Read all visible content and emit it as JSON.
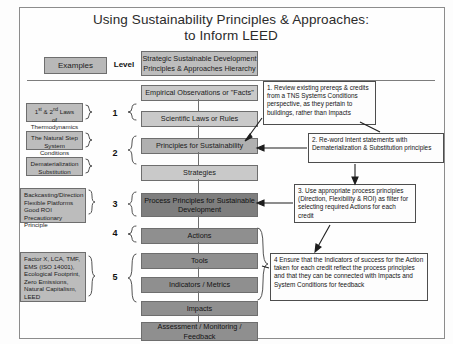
{
  "title": {
    "line1": "Using Sustainability Principles & Approaches:",
    "line2": "to Inform LEED"
  },
  "header": {
    "examples_label": "Examples",
    "level_label": "Level",
    "hierarchy_line1": "Strategic Sustainable Development",
    "hierarchy_line2": "Principles & Approaches Hierarchy"
  },
  "hierarchy": {
    "rows": [
      {
        "label": "Empirical Observations or \"Facts\"",
        "tone": "tone-light"
      },
      {
        "label": "Scientific Laws or Rules",
        "tone": "tone-light"
      },
      {
        "label": "Principles for Sustainability",
        "tone": "tone-mid"
      },
      {
        "label": "Strategies",
        "tone": "tone-light"
      },
      {
        "label": "Process Principles for Sustainable Development",
        "tone": "tone-darker"
      },
      {
        "label": "Actions",
        "tone": "tone-dark"
      },
      {
        "label": "Tools",
        "tone": "tone-dark"
      },
      {
        "label": "Indicators / Metrics",
        "tone": "tone-dark"
      },
      {
        "label": "Impacts",
        "tone": "tone-dark"
      },
      {
        "label": "Assessment / Monitoring / Feedback",
        "tone": "tone-dark"
      }
    ]
  },
  "levels": {
    "numbers": [
      "1",
      "2",
      "3",
      "4",
      "5"
    ]
  },
  "examples": [
    {
      "lines": "1st & 2nd Laws of Thermodynamics"
    },
    {
      "lines": "The Natural Step System Conditions"
    },
    {
      "lines": "Dematerialization Substitution"
    },
    {
      "lines": "Backcasting/Direction Flexible Platforms Good ROI Precautionary Principle"
    },
    {
      "lines": "Factor X, LCA, TMF, EMS (ISO 14001), Ecological Footprint, Zero Emissions, Natural Capitalism, LEED"
    }
  ],
  "example_text": {
    "e1_l1": "1",
    "e1_sup1": "st",
    "e1_mid": " & 2",
    "e1_sup2": "nd",
    "e1_end": " Laws",
    "e1_l2": "of Thermodynamics",
    "e2_l1": "The Natural Step",
    "e2_l2": "System Conditions",
    "e3_l1": "Dematerialization",
    "e3_l2": "Substitution",
    "e4_l1": "Backcasting/Direction",
    "e4_l2": "Flexible Platforms",
    "e4_l3": "Good ROI",
    "e4_l4": "Precautionary Principle",
    "e5_l1": "Factor X, LCA, TMF,",
    "e5_l2": "EMS (ISO 14001),",
    "e5_l3": "Ecological Footprint,",
    "e5_l4": "Zero Emissions,",
    "e5_l5": "Natural Capitalism,",
    "e5_l6": "LEED"
  },
  "notes": [
    {
      "id": "note-1",
      "text": "1. Review existing prereqs & credits from a TNS Systems Conditions perspective, as they pertain to buildings, rather than Impacts"
    },
    {
      "id": "note-2",
      "text": "2. Re-word Intent statements with Dematerialization & Substitution principles"
    },
    {
      "id": "note-3",
      "text": "3. Use appropriate process principles (Direction, Flexibility & ROI) as filter for selecting required Actions for each credit"
    },
    {
      "id": "note-4",
      "text": "4 Ensure that the Indicators of success for the Action taken for each credit reflect the process principles and that they can be connected with Impacts and System Conditions for feedback"
    }
  ],
  "colors": {
    "border": "#6e6e6e",
    "light": "#c9c9c9",
    "mid": "#b0b0b0",
    "dark": "#8f8f8f",
    "darker": "#7e7e7e",
    "page": "#fdfdfd"
  }
}
